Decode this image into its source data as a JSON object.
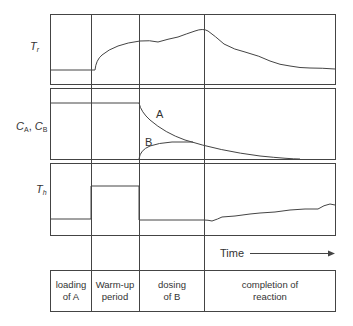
{
  "diagram": {
    "y_labels": {
      "reactor_temp": {
        "main": "T",
        "sub": "r"
      },
      "concentrations": {
        "part1_main": "C",
        "part1_sub": "A",
        "sep": ", ",
        "part2_main": "C",
        "part2_sub": "B"
      },
      "heating_temp": {
        "main": "T",
        "sub": "h"
      }
    },
    "curve_labels": {
      "a": "A",
      "b": "B"
    },
    "time_axis_label": "Time",
    "phases": [
      {
        "line1": "loading",
        "line2": "of A"
      },
      {
        "line1": "Warm-up",
        "line2": "period"
      },
      {
        "line1": "dosing",
        "line2": "of B"
      },
      {
        "line1": "completion of",
        "line2": "reaction"
      }
    ],
    "line_color": "#444444"
  }
}
